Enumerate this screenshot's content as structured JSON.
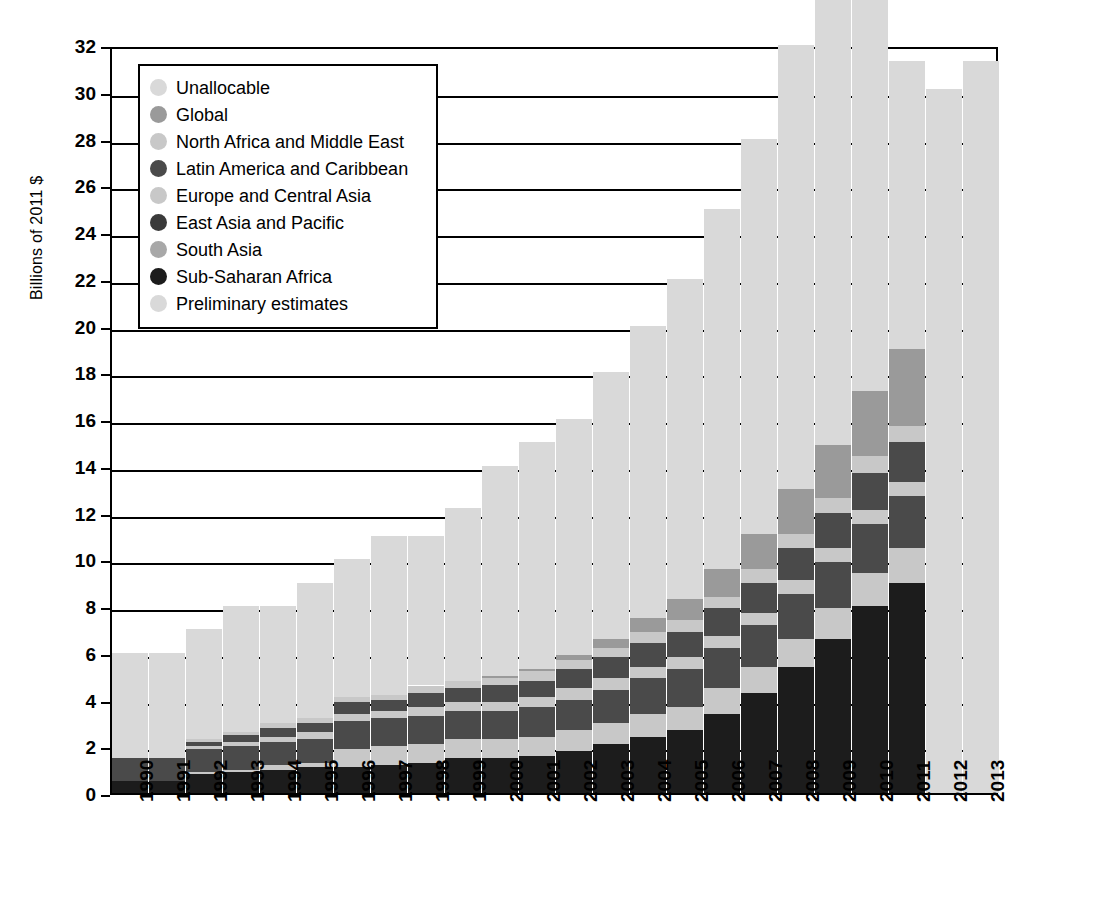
{
  "chart_data": {
    "type": "bar",
    "stacked": true,
    "title": "",
    "xlabel": "",
    "ylabel": "Billions of 2011 $",
    "ylim": [
      0,
      32
    ],
    "ytick_step": 2,
    "yticks": [
      0,
      2,
      4,
      6,
      8,
      10,
      12,
      14,
      16,
      18,
      20,
      22,
      24,
      26,
      28,
      30,
      32
    ],
    "grid": true,
    "legend_position": "top-left",
    "categories": [
      "1990",
      "1991",
      "1992",
      "1993",
      "1994",
      "1995",
      "1996",
      "1997",
      "1998",
      "1999",
      "2000",
      "2001",
      "2002",
      "2003",
      "2004",
      "2005",
      "2006",
      "2007",
      "2008",
      "2009",
      "2010",
      "2011",
      "2012",
      "2013"
    ],
    "series": [
      {
        "name": "Sub-Saharan Africa",
        "color": "#1c1c1c",
        "values": [
          0.5,
          0.5,
          0.8,
          0.9,
          1.0,
          1.1,
          1.1,
          1.2,
          1.3,
          1.5,
          1.5,
          1.6,
          1.8,
          2.1,
          2.4,
          2.7,
          3.4,
          4.3,
          5.4,
          6.6,
          8.0,
          9.0,
          null,
          null
        ]
      },
      {
        "name": "South Asia",
        "color": "#c8c8c8",
        "values": [
          0.0,
          0.0,
          0.1,
          0.1,
          0.2,
          0.2,
          0.8,
          0.8,
          0.8,
          0.8,
          0.8,
          0.8,
          0.9,
          0.9,
          1.0,
          1.0,
          1.1,
          1.1,
          1.2,
          1.3,
          1.4,
          1.5,
          null,
          null
        ]
      },
      {
        "name": "East Asia and Pacific",
        "color": "#4a4a4a",
        "values": [
          1.0,
          1.0,
          1.0,
          1.0,
          1.0,
          1.0,
          1.2,
          1.2,
          1.2,
          1.2,
          1.2,
          1.3,
          1.3,
          1.4,
          1.5,
          1.6,
          1.7,
          1.8,
          1.9,
          2.0,
          2.1,
          2.2,
          null,
          null
        ]
      },
      {
        "name": "Europe and Central Asia",
        "color": "#c8c8c8",
        "values": [
          0.0,
          0.0,
          0.1,
          0.2,
          0.2,
          0.3,
          0.3,
          0.3,
          0.4,
          0.4,
          0.4,
          0.4,
          0.5,
          0.5,
          0.5,
          0.5,
          0.5,
          0.5,
          0.6,
          0.6,
          0.6,
          0.6,
          null,
          null
        ]
      },
      {
        "name": "Latin America and Caribbean",
        "color": "#4a4a4a",
        "values": [
          0.0,
          0.0,
          0.2,
          0.3,
          0.4,
          0.4,
          0.5,
          0.5,
          0.6,
          0.6,
          0.7,
          0.7,
          0.8,
          0.9,
          1.0,
          1.1,
          1.2,
          1.3,
          1.4,
          1.5,
          1.6,
          1.7,
          null,
          null
        ]
      },
      {
        "name": "North Africa and Middle East",
        "color": "#c8c8c8",
        "values": [
          0.0,
          0.0,
          0.1,
          0.1,
          0.2,
          0.2,
          0.2,
          0.2,
          0.3,
          0.3,
          0.3,
          0.4,
          0.4,
          0.4,
          0.5,
          0.5,
          0.5,
          0.6,
          0.6,
          0.6,
          0.7,
          0.7,
          null,
          null
        ]
      },
      {
        "name": "Global",
        "color": "#9a9a9a",
        "values": [
          0.0,
          0.0,
          0.0,
          0.0,
          0.0,
          0.0,
          0.0,
          0.0,
          0.0,
          0.0,
          0.1,
          0.1,
          0.2,
          0.4,
          0.6,
          0.9,
          1.2,
          1.5,
          1.9,
          2.3,
          2.8,
          3.3,
          null,
          null
        ]
      },
      {
        "name": "Unallocable",
        "color": "#d9d9d9",
        "values": [
          4.5,
          4.5,
          4.7,
          5.4,
          5.0,
          5.8,
          5.9,
          6.8,
          6.4,
          7.4,
          9.0,
          9.7,
          10.1,
          11.4,
          12.5,
          13.7,
          15.4,
          16.9,
          19.0,
          21.1,
          22.8,
          12.3,
          null,
          null
        ]
      },
      {
        "name": "Preliminary estimates",
        "color": "#d9d9d9",
        "values": [
          null,
          null,
          null,
          null,
          null,
          null,
          null,
          null,
          null,
          null,
          null,
          null,
          null,
          null,
          null,
          null,
          null,
          null,
          null,
          null,
          null,
          null,
          30.1,
          31.3
        ]
      }
    ],
    "totals": [
      6.0,
      6.0,
      7.0,
      8.0,
      8.0,
      9.0,
      10.0,
      11.0,
      11.0,
      12.0,
      14.0,
      15.0,
      16.0,
      18.0,
      20.0,
      22.0,
      25.0,
      28.0,
      32.0,
      36.0,
      40.0,
      31.3,
      30.1,
      31.3
    ],
    "bar_totals_displayed": [
      6.0,
      6.0,
      7.0,
      8.0,
      8.0,
      9.0,
      10.0,
      11.0,
      11.0,
      12.0,
      14.0,
      15.0,
      16.0,
      18.0,
      20.0,
      22.0,
      25.4,
      27.9,
      31.3,
      30.1,
      31.3
    ]
  },
  "legend": {
    "items": [
      {
        "label": "Unallocable",
        "color": "#d9d9d9"
      },
      {
        "label": "Global",
        "color": "#9a9a9a"
      },
      {
        "label": "North Africa and Middle East",
        "color": "#c8c8c8"
      },
      {
        "label": "Latin America and Caribbean",
        "color": "#4a4a4a"
      },
      {
        "label": "Europe and Central Asia",
        "color": "#c8c8c8"
      },
      {
        "label": "East Asia and Pacific",
        "color": "#3a3a3a"
      },
      {
        "label": "South Asia",
        "color": "#a8a8a8"
      },
      {
        "label": "Sub-Saharan Africa",
        "color": "#1c1c1c"
      },
      {
        "label": "Preliminary estimates",
        "color": "#d9d9d9"
      }
    ]
  }
}
